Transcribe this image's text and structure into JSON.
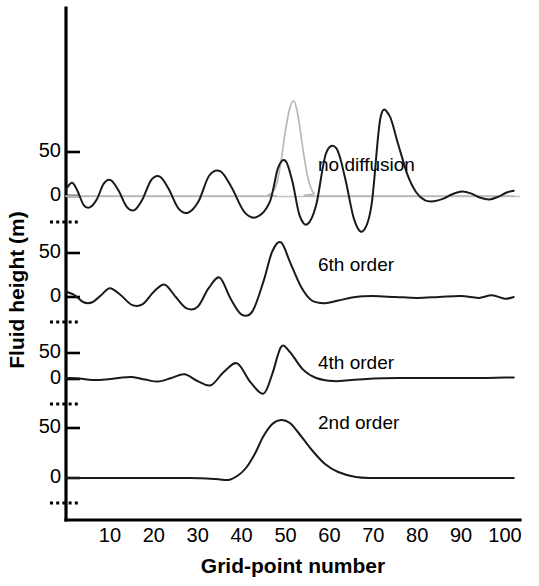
{
  "figure": {
    "background": "#ffffff",
    "curve_color": "#1a1a1a",
    "reference_color": "#b8b8b8"
  },
  "axes": {
    "x_title": "Grid-point number",
    "y_title": "Fluid height (m)",
    "x_ticks": [
      10,
      20,
      30,
      40,
      50,
      60,
      70,
      80,
      90,
      100
    ],
    "x_range": [
      0,
      102
    ],
    "panel_y_ticks": [
      "50",
      "0"
    ],
    "panel_y_tick_values": [
      50,
      0
    ],
    "y_axis_break_marker": "dotted"
  },
  "panels": [
    {
      "label": "no diffusion",
      "label_x": 52,
      "label_y": 33
    },
    {
      "label": "6th order",
      "label_x": 52,
      "label_y": 33
    },
    {
      "label": "4th order",
      "label_x": 52,
      "label_y": 33
    },
    {
      "label": "2nd order",
      "label_x": 52,
      "label_y": 33
    }
  ],
  "chart_data": {
    "type": "line",
    "title": "",
    "xlabel": "Grid-point number",
    "ylabel": "Fluid height (m)",
    "xlim": [
      0,
      102
    ],
    "ylim": [
      -40,
      110
    ],
    "grid": false,
    "legend": "inline-annotations",
    "series": [
      {
        "name": "initial condition (reference)",
        "panel": 0,
        "color": "#b8b8b8",
        "x": [
          0,
          44,
          46,
          47,
          48,
          49,
          50,
          51,
          51.8,
          52.5,
          53.2,
          54,
          54.8,
          55.6,
          56.5,
          58,
          102
        ],
        "y": [
          0,
          0,
          1,
          4,
          14,
          40,
          75,
          100,
          108,
          100,
          80,
          52,
          28,
          12,
          3,
          0,
          0
        ]
      },
      {
        "name": "no diffusion",
        "panel": 0,
        "color": "#1a1a1a",
        "x": [
          0,
          1.4,
          2.6,
          4.0,
          5.4,
          7.0,
          8.6,
          10.2,
          12.0,
          13.8,
          15.6,
          17.4,
          19.4,
          21.4,
          23.4,
          25.6,
          27.8,
          30.2,
          32.6,
          35.2,
          37.8,
          40.6,
          43.4,
          46.4,
          48.3,
          50.0,
          51.6,
          53.2,
          55.0,
          57.0,
          59.2,
          61.6,
          63.6,
          65.6,
          67.6,
          69.6,
          71.6,
          73.6,
          75.6,
          77.8,
          79.8,
          81.8,
          83.8,
          86.0,
          88.0,
          90.2,
          92.2,
          94.4,
          96.4,
          98.4,
          100.4,
          102
        ],
        "y": [
          8,
          15,
          6,
          -10,
          -13,
          -4,
          14,
          18,
          6,
          -12,
          -16,
          -4,
          18,
          22,
          8,
          -14,
          -19,
          -6,
          23,
          28,
          9,
          -18,
          -24,
          -7,
          32,
          40,
          16,
          -22,
          -32,
          -10,
          48,
          54,
          20,
          -26,
          -40,
          -10,
          88,
          92,
          60,
          24,
          4,
          -5,
          -6,
          -3,
          2,
          5,
          3,
          -2,
          -4,
          -1,
          4,
          6
        ],
        "note": "strong dispersive ripples of growing amplitude ahead of and behind the main peak; main peak reaches about 92 m near grid point 48; small growing ripples in the downstream tail out to grid point 100"
      },
      {
        "name": "6th order",
        "panel": 1,
        "color": "#1a1a1a",
        "x": [
          0,
          2,
          4,
          6,
          8,
          10,
          12.5,
          15,
          17.5,
          20,
          22.5,
          25,
          27.5,
          30,
          32.5,
          35,
          37.5,
          40,
          42.5,
          45,
          47,
          49,
          51,
          53.5,
          56,
          59,
          62,
          66,
          70,
          75,
          80,
          85,
          90,
          94,
          97,
          100,
          102
        ],
        "y": [
          6,
          2,
          -6,
          -6,
          2,
          10,
          2,
          -9,
          -8,
          6,
          14,
          0,
          -13,
          -11,
          10,
          22,
          -2,
          -20,
          -16,
          18,
          52,
          62,
          40,
          12,
          -4,
          -7,
          -4,
          0,
          1,
          0,
          -1,
          0,
          1,
          -1,
          2,
          -2,
          0
        ],
        "note": "moderate ripples; main peak about 62 m near grid point 49; nearly flat tail with faint oscillation"
      },
      {
        "name": "4th order",
        "panel": 2,
        "color": "#1a1a1a",
        "x": [
          0,
          3,
          6,
          9,
          12,
          15,
          18,
          21,
          24,
          27,
          30,
          33,
          36,
          39,
          42,
          45,
          47,
          49,
          51,
          54,
          57,
          61,
          65,
          70,
          76,
          82,
          88,
          94,
          100,
          102
        ],
        "y": [
          2,
          1,
          -2,
          -1,
          2,
          4,
          -1,
          -5,
          2,
          9,
          -4,
          -12,
          14,
          30,
          -6,
          -28,
          10,
          62,
          52,
          18,
          2,
          -4,
          -2,
          1,
          2,
          2,
          2,
          2,
          3,
          3
        ],
        "note": "small ripples only; main peak about 62 m near grid point 49; smooth flat tail"
      },
      {
        "name": "2nd order",
        "panel": 3,
        "color": "#1a1a1a",
        "x": [
          0,
          10,
          20,
          28,
          34,
          37,
          39,
          41,
          43,
          45,
          47,
          49,
          51,
          53,
          56,
          59,
          62,
          66,
          70,
          76,
          82,
          88,
          94,
          100,
          102
        ],
        "y": [
          0,
          0,
          0,
          0,
          -1,
          -2,
          2,
          10,
          24,
          42,
          54,
          58,
          55,
          45,
          28,
          14,
          6,
          1,
          0,
          0,
          0,
          0,
          0,
          0,
          0
        ],
        "note": "heavily damped, single smooth broad peak of about 58 m near grid point 49; no ripples"
      }
    ]
  }
}
